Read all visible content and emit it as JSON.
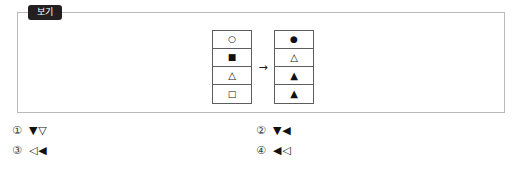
{
  "panel": {
    "badge_label": "보기",
    "badge_color": "#231f20",
    "border_color": "#b9b9b9"
  },
  "diagram": {
    "arrow": "→",
    "arrow_name": "right-arrow-icon",
    "left_table": {
      "name": "left-shape-table",
      "cells": [
        {
          "glyph": "○",
          "name": "white-circle-icon"
        },
        {
          "glyph": "■",
          "name": "black-square-icon"
        },
        {
          "glyph": "△",
          "name": "white-up-triangle-icon"
        },
        {
          "glyph": "□",
          "name": "white-square-icon"
        }
      ]
    },
    "right_table": {
      "name": "right-shape-table",
      "cells": [
        {
          "glyph": "●",
          "name": "black-circle-icon"
        },
        {
          "glyph": "△",
          "name": "white-up-triangle-icon"
        },
        {
          "glyph": "▲",
          "name": "black-up-triangle-icon"
        },
        {
          "glyph": "▲",
          "name": "black-up-triangle-icon"
        }
      ]
    }
  },
  "choices": [
    {
      "number": "①",
      "answer": "▼▽"
    },
    {
      "number": "②",
      "answer": "▼◀"
    },
    {
      "number": "③",
      "answer": "◁◀"
    },
    {
      "number": "④",
      "answer": "◀◁"
    }
  ]
}
